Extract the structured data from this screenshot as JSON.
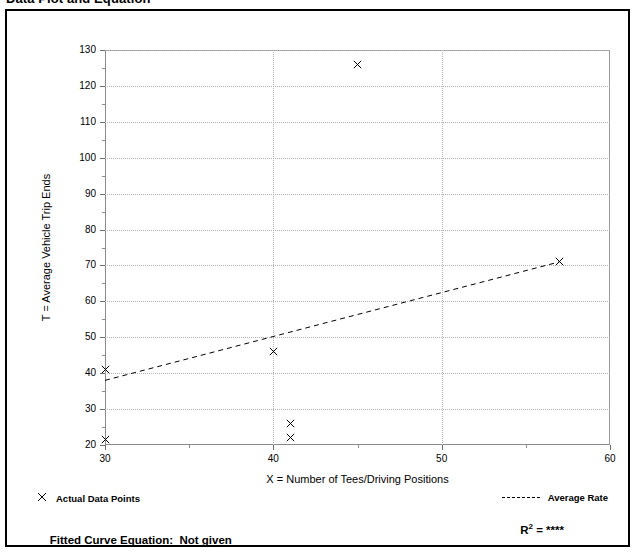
{
  "page": {
    "title": "Data Plot and Equation"
  },
  "legend": {
    "points_marker": "x-cross-marker",
    "points_label": "Actual Data Points",
    "line_marker": "dashed-line-swatch",
    "line_label": "Average Rate"
  },
  "footer": {
    "equation_label": "Fitted Curve Equation:",
    "equation_value": "Not given",
    "rsq_label": "R",
    "rsq_exponent": "2",
    "rsq_equals": " = ",
    "rsq_value": "****"
  },
  "chart_data": {
    "type": "scatter",
    "title": "Data Plot and Equation",
    "xlabel": "X = Number of Tees/Driving Positions",
    "ylabel": "T = Average Vehicle Trip Ends",
    "xlim": [
      30,
      60
    ],
    "ylim": [
      20,
      130
    ],
    "xticks": [
      30,
      40,
      50,
      60
    ],
    "xticks_minor": [
      35,
      45,
      55
    ],
    "yticks": [
      20,
      30,
      40,
      50,
      60,
      70,
      80,
      90,
      100,
      110,
      120,
      130
    ],
    "yticks_minor": [
      25,
      35,
      45,
      55,
      65,
      75,
      85,
      95,
      105,
      115,
      125
    ],
    "xtick_labels": [
      "30",
      "40",
      "50",
      "60"
    ],
    "ytick_labels": [
      "20",
      "30",
      "40",
      "50",
      "60",
      "70",
      "80",
      "90",
      "100",
      "110",
      "120",
      "130"
    ],
    "grid": true,
    "grid_style": "dotted",
    "grid_vertical_at": [
      40,
      50
    ],
    "legend_position": "below-plot",
    "series": [
      {
        "name": "Actual Data Points",
        "type": "scatter",
        "marker": "x",
        "color": "#000000",
        "points": [
          {
            "x": 30,
            "y": 41
          },
          {
            "x": 30,
            "y": 21.5
          },
          {
            "x": 40,
            "y": 46
          },
          {
            "x": 41,
            "y": 26
          },
          {
            "x": 41,
            "y": 22
          },
          {
            "x": 45,
            "y": 126
          },
          {
            "x": 57,
            "y": 71
          }
        ]
      },
      {
        "name": "Average Rate",
        "type": "line",
        "style": "dashed",
        "color": "#000000",
        "points": [
          {
            "x": 30,
            "y": 38
          },
          {
            "x": 57,
            "y": 71
          }
        ]
      }
    ]
  }
}
